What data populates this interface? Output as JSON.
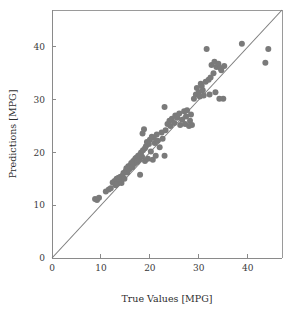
{
  "chart_data": {
    "type": "scatter",
    "title": "",
    "subtitle": "",
    "xlabel": "True Values [MPG]",
    "ylabel": "Predictions [MPG]",
    "xlim": [
      0,
      47
    ],
    "ylim": [
      0,
      47
    ],
    "xticks": [
      0,
      10,
      20,
      30,
      40
    ],
    "yticks": [
      0,
      10,
      20,
      30,
      40
    ],
    "xtick_labels": [
      "0",
      "10",
      "20",
      "30",
      "40"
    ],
    "ytick_labels": [
      "0",
      "10",
      "20",
      "30",
      "40"
    ],
    "grid": false,
    "legend": null,
    "legend_position": "none",
    "marker_color": "#7a7a7a",
    "marker_size": 6,
    "reference_line": {
      "name": "identity-line",
      "type": "line",
      "equation": "y = x",
      "from": [
        0,
        0
      ],
      "to": [
        47,
        47
      ],
      "color": "#7d7d7d"
    },
    "series": [
      {
        "name": "predictions",
        "points": [
          [
            8.8,
            11.2
          ],
          [
            9.2,
            11.0
          ],
          [
            9.6,
            11.4
          ],
          [
            11.0,
            12.6
          ],
          [
            11.6,
            13.0
          ],
          [
            12.0,
            13.2
          ],
          [
            12.4,
            14.3
          ],
          [
            12.8,
            14.6
          ],
          [
            13.0,
            13.8
          ],
          [
            13.2,
            15.0
          ],
          [
            13.4,
            14.1
          ],
          [
            13.6,
            15.2
          ],
          [
            13.8,
            14.8
          ],
          [
            14.0,
            15.4
          ],
          [
            14.2,
            14.2
          ],
          [
            14.4,
            15.6
          ],
          [
            14.6,
            16.1
          ],
          [
            14.8,
            15.0
          ],
          [
            15.0,
            16.4
          ],
          [
            15.2,
            17.0
          ],
          [
            15.4,
            16.2
          ],
          [
            15.6,
            17.4
          ],
          [
            15.8,
            16.8
          ],
          [
            16.0,
            17.6
          ],
          [
            16.2,
            18.0
          ],
          [
            16.4,
            17.2
          ],
          [
            16.6,
            18.4
          ],
          [
            16.8,
            17.8
          ],
          [
            17.0,
            18.8
          ],
          [
            17.2,
            19.0
          ],
          [
            17.4,
            18.2
          ],
          [
            17.6,
            19.4
          ],
          [
            17.8,
            18.6
          ],
          [
            18.0,
            15.8
          ],
          [
            18.0,
            19.6
          ],
          [
            18.2,
            20.0
          ],
          [
            18.4,
            19.2
          ],
          [
            18.5,
            23.6
          ],
          [
            18.6,
            20.4
          ],
          [
            18.8,
            24.4
          ],
          [
            19.0,
            20.8
          ],
          [
            19.0,
            18.4
          ],
          [
            19.2,
            21.2
          ],
          [
            19.4,
            22.0
          ],
          [
            19.6,
            18.8
          ],
          [
            19.8,
            21.6
          ],
          [
            20.0,
            22.4
          ],
          [
            20.2,
            20.2
          ],
          [
            20.4,
            23.0
          ],
          [
            20.6,
            18.6
          ],
          [
            20.8,
            22.8
          ],
          [
            21.0,
            21.8
          ],
          [
            21.2,
            19.4
          ],
          [
            21.4,
            23.4
          ],
          [
            21.6,
            22.2
          ],
          [
            22.0,
            21.0
          ],
          [
            22.4,
            23.8
          ],
          [
            22.6,
            22.6
          ],
          [
            23.0,
            19.4
          ],
          [
            23.0,
            28.6
          ],
          [
            23.2,
            24.2
          ],
          [
            23.6,
            25.4
          ],
          [
            24.0,
            26.0
          ],
          [
            24.2,
            25.0
          ],
          [
            24.5,
            26.4
          ],
          [
            25.0,
            25.6
          ],
          [
            25.2,
            27.0
          ],
          [
            25.6,
            26.6
          ],
          [
            26.0,
            27.4
          ],
          [
            26.2,
            25.2
          ],
          [
            26.6,
            26.2
          ],
          [
            27.0,
            27.8
          ],
          [
            27.2,
            25.4
          ],
          [
            27.4,
            26.8
          ],
          [
            27.6,
            28.0
          ],
          [
            28.0,
            25.0
          ],
          [
            28.2,
            26.0
          ],
          [
            28.4,
            27.2
          ],
          [
            28.6,
            25.2
          ],
          [
            29.0,
            30.2
          ],
          [
            29.4,
            31.0
          ],
          [
            29.6,
            32.2
          ],
          [
            30.0,
            31.4
          ],
          [
            30.2,
            30.6
          ],
          [
            30.4,
            33.0
          ],
          [
            30.6,
            32.6
          ],
          [
            30.8,
            31.8
          ],
          [
            31.0,
            30.8
          ],
          [
            31.4,
            33.4
          ],
          [
            31.6,
            39.6
          ],
          [
            32.0,
            33.8
          ],
          [
            32.2,
            31.0
          ],
          [
            32.4,
            34.2
          ],
          [
            32.6,
            36.6
          ],
          [
            33.0,
            35.0
          ],
          [
            33.2,
            37.2
          ],
          [
            33.4,
            31.4
          ],
          [
            33.6,
            36.2
          ],
          [
            34.0,
            36.8
          ],
          [
            34.2,
            30.2
          ],
          [
            34.4,
            36.0
          ],
          [
            34.6,
            35.6
          ],
          [
            35.0,
            30.2
          ],
          [
            35.2,
            36.4
          ],
          [
            38.8,
            40.6
          ],
          [
            43.6,
            37.0
          ],
          [
            44.2,
            39.6
          ]
        ]
      }
    ]
  },
  "axes": {
    "x_axis_name": "x-axis",
    "y_axis_name": "y-axis"
  }
}
